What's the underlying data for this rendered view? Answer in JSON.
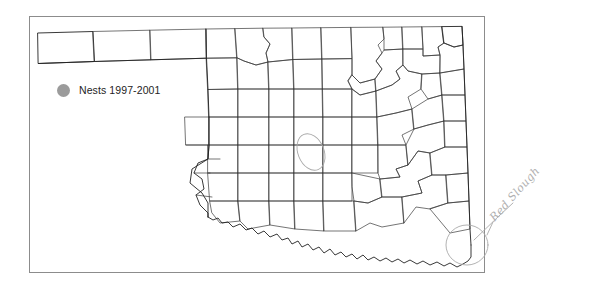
{
  "figure": {
    "kind": "distribution-map",
    "region": "Oklahoma",
    "subject_counties": 77,
    "frame_color": "#8c8c8c",
    "background_color": "#ffffff"
  },
  "legend": {
    "label": "Nests 1997-2001",
    "swatch_shape": "filled-circle",
    "swatch_color": "#9b9b9b",
    "text_color": "#242424",
    "position": "upper-left"
  },
  "annotations": [
    {
      "name": "red-slough-annotation",
      "text": "Red Slough",
      "style": "handwritten-pencil",
      "color": "#b0b0b0",
      "rotation_deg": -48,
      "points_to": "southeast-corner-oklahoma"
    },
    {
      "name": "central-oklahoma-circle",
      "text": "",
      "style": "handwritten-pencil-ellipse",
      "color": "#b8b8b8",
      "rotation_deg": 0,
      "points_to": "central-oklahoma"
    },
    {
      "name": "southeast-corner-circle",
      "text": "",
      "style": "handwritten-pencil-ellipse",
      "color": "#b8b8b8",
      "rotation_deg": 0,
      "points_to": "mccurtain-county-corner"
    }
  ],
  "map": {
    "outline_name": "oklahoma-state-outline",
    "county_layer_name": "oklahoma-county-boundaries",
    "stroke_color": "#3a3a3a",
    "state_stroke_color": "#222222",
    "fill_color": "#ffffff",
    "data_points": []
  }
}
